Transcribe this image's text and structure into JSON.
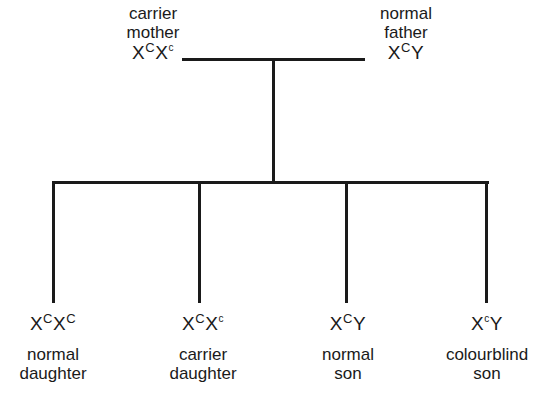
{
  "parents": {
    "mother": {
      "label_line1": "carrier",
      "label_line2": "mother",
      "genotype": [
        {
          "base": "X",
          "sup": "C",
          "recessive": false
        },
        {
          "base": "X",
          "sup": "c",
          "recessive": true
        }
      ]
    },
    "father": {
      "label_line1": "normal",
      "label_line2": "father",
      "genotype": [
        {
          "base": "X",
          "sup": "C",
          "recessive": false
        },
        {
          "base": "Y",
          "sup": "",
          "recessive": false
        }
      ]
    }
  },
  "children": [
    {
      "label_line1": "normal",
      "label_line2": "daughter",
      "genotype": [
        {
          "base": "X",
          "sup": "C",
          "recessive": false
        },
        {
          "base": "X",
          "sup": "C",
          "recessive": false
        }
      ]
    },
    {
      "label_line1": "carrier",
      "label_line2": "daughter",
      "genotype": [
        {
          "base": "X",
          "sup": "C",
          "recessive": false
        },
        {
          "base": "X",
          "sup": "c",
          "recessive": true
        }
      ]
    },
    {
      "label_line1": "normal",
      "label_line2": "son",
      "genotype": [
        {
          "base": "X",
          "sup": "C",
          "recessive": false
        },
        {
          "base": "Y",
          "sup": "",
          "recessive": false
        }
      ]
    },
    {
      "label_line1": "colourblind",
      "label_line2": "son",
      "genotype": [
        {
          "base": "X",
          "sup": "c",
          "recessive": true
        },
        {
          "base": "Y",
          "sup": "",
          "recessive": false
        }
      ]
    }
  ]
}
